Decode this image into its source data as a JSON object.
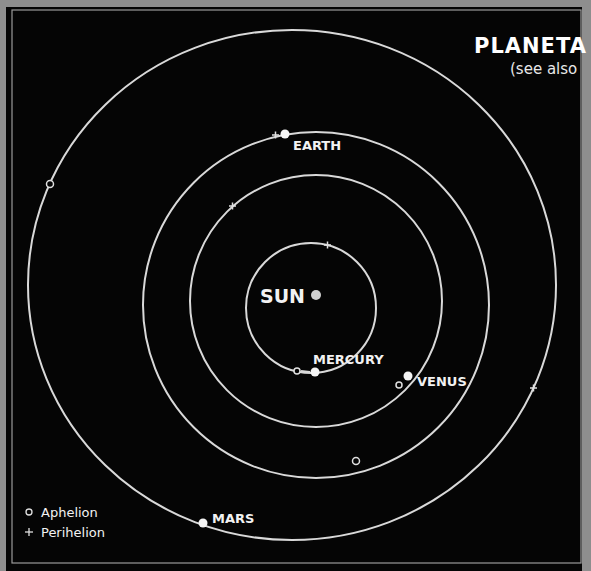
{
  "title": "PLANETA",
  "subtitle": "(see also",
  "sun": {
    "label": "SUN"
  },
  "planets": [
    {
      "name": "MERCURY",
      "label": "MERCURY"
    },
    {
      "name": "VENUS",
      "label": "VENUS"
    },
    {
      "name": "EARTH",
      "label": "EARTH"
    },
    {
      "name": "MARS",
      "label": "MARS"
    }
  ],
  "legend": {
    "aphelion": {
      "symbol": "o",
      "label": "Aphelion"
    },
    "perihelion": {
      "symbol": "+",
      "label": "Perihelion"
    }
  },
  "colors": {
    "background": "#050505",
    "orbit": "#d9d9d9",
    "frame": "#8e8e8e",
    "text": "#f2f2f2"
  }
}
